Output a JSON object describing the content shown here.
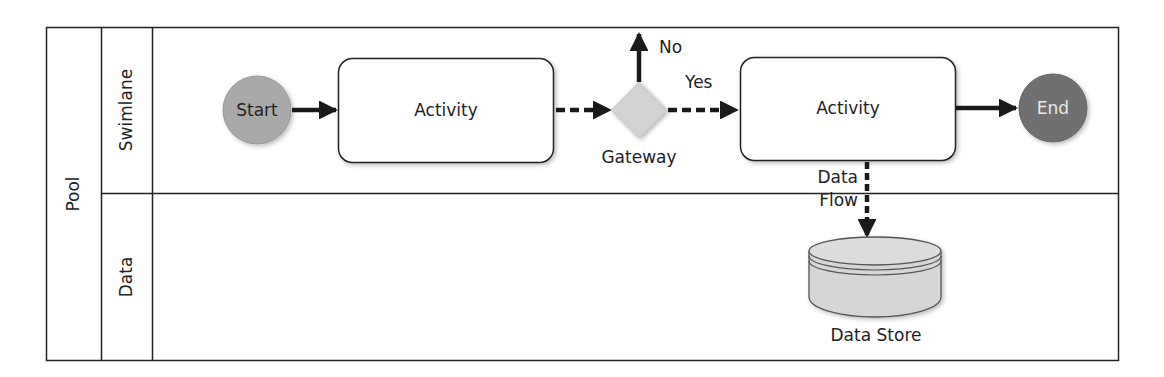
{
  "pool": {
    "label": "Pool"
  },
  "lanes": [
    {
      "label": "Swimlane"
    },
    {
      "label": "Data"
    }
  ],
  "nodes": {
    "start": {
      "label": "Start",
      "color": "#a9a9a9"
    },
    "activity1": {
      "label": "Activity"
    },
    "gateway": {
      "label": "Gateway",
      "color": "#d3d3d3"
    },
    "activity2": {
      "label": "Activity"
    },
    "end": {
      "label": "End",
      "color": "#6f6f6f"
    },
    "datastore": {
      "label": "Data Store",
      "color": "#d6d6d6"
    }
  },
  "edges": {
    "gateway_no": {
      "label": "No"
    },
    "gateway_yes": {
      "label": "Yes"
    },
    "data_flow": {
      "label_line1": "Data",
      "label_line2": "Flow"
    }
  }
}
